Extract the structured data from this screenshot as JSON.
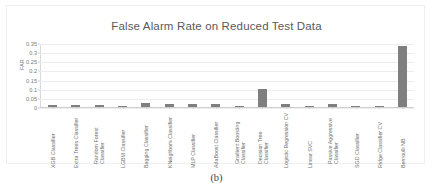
{
  "figure": {
    "caption": "(b)"
  },
  "chart_data": {
    "type": "bar",
    "title": "False Alarm Rate on Reduced Test Data",
    "xlabel": "",
    "ylabel": "FAR",
    "ylim": [
      0,
      0.35
    ],
    "yticks": [
      "0",
      "0.05",
      "0.1",
      "0.15",
      "0.2",
      "0.25",
      "0.3",
      "0.35"
    ],
    "ytick_values": [
      0,
      0.05,
      0.1,
      0.15,
      0.2,
      0.25,
      0.3,
      0.35
    ],
    "grid": true,
    "legend": false,
    "bar_color": "#7f7f7f",
    "categories": [
      "XGB Classifier",
      "Extra Trees Classifier",
      "Random Forest Classifier",
      "LGBM Classifier",
      "Bagging Classifier",
      "KNeighbors Classifier",
      "MLP Classifier",
      "AdaBoost Classifier",
      "Gradient Boosting Classifier",
      "Decision Tree Classifier",
      "Logistic Regression CV",
      "Linear SVC",
      "Passive Aggressive Classifier",
      "SGD Classifier",
      "Ridge Classifier CV",
      "Bernoulli NB"
    ],
    "values": [
      0.011,
      0.012,
      0.012,
      0.007,
      0.022,
      0.019,
      0.019,
      0.019,
      0.008,
      0.1,
      0.014,
      0.007,
      0.019,
      0.001,
      0.001,
      0.335
    ]
  }
}
